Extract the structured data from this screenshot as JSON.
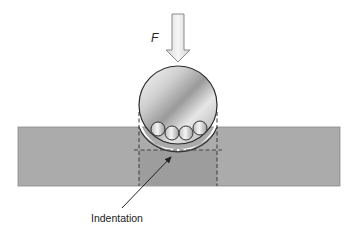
{
  "diagram": {
    "type": "indentation-schematic",
    "labels": {
      "force": "F",
      "indentation": "Indentation"
    },
    "elements": {
      "force_arrow": {
        "direction": "down",
        "color": "#e6e6e6",
        "stroke": "#8a8a8a"
      },
      "indenter": {
        "shape": "sphere",
        "radius_px": 39,
        "center": [
          178,
          105
        ]
      },
      "particles": {
        "count": 4,
        "shape": "circle"
      },
      "substrate": {
        "shape": "rectangle",
        "color": "#ababab"
      },
      "indentation_zone": {
        "outline": "dashed",
        "color": "#9c9c9c"
      },
      "leader_arrow": {
        "from": [
          122,
          208
        ],
        "to": [
          173,
          155
        ]
      }
    },
    "colors": {
      "background": "#ffffff",
      "substrate": "#ababab",
      "substrate_edge": "#7a7a7a",
      "indent_zone": "#9d9d9d",
      "dash": "#555555",
      "sphere_light": "#f2f2f2",
      "sphere_dark": "#8e8e8e",
      "outline": "#333333"
    }
  }
}
